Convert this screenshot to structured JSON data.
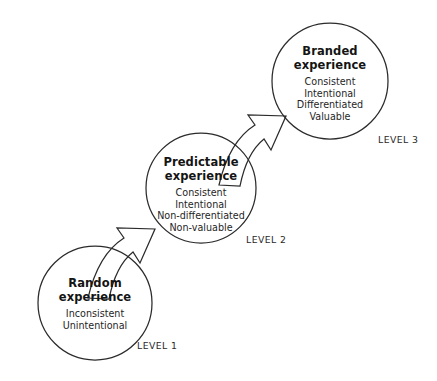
{
  "diagram": {
    "type": "progression-diagram",
    "background_color": "#ffffff",
    "stroke_color": "#2b2b2b",
    "text_color": "#1a1a1a",
    "nodes": [
      {
        "id": "random",
        "title_lines": [
          "Random",
          "experience"
        ],
        "attributes": [
          "Inconsistent",
          "Unintentional"
        ],
        "level_label": "LEVEL 1",
        "circle": {
          "cx": 95,
          "cy": 303,
          "r": 57
        },
        "level_label_pos": {
          "x": 137,
          "y": 340
        }
      },
      {
        "id": "predictable",
        "title_lines": [
          "Predictable",
          "experience"
        ],
        "attributes": [
          "Consistent",
          "Intentional",
          "Non-differentiated",
          "Non-valuable"
        ],
        "level_label": "LEVEL 2",
        "circle": {
          "cx": 201,
          "cy": 188,
          "r": 55
        },
        "level_label_pos": {
          "x": 246,
          "y": 234
        }
      },
      {
        "id": "branded",
        "title_lines": [
          "Branded",
          "experience"
        ],
        "attributes": [
          "Consistent",
          "Intentional",
          "Differentiated",
          "Valuable"
        ],
        "level_label": "LEVEL 3",
        "circle": {
          "cx": 330,
          "cy": 81,
          "r": 58
        },
        "level_label_pos": {
          "x": 378,
          "y": 134
        }
      }
    ],
    "arrows": [
      {
        "id": "arrow-random-to-predictable",
        "from": "random",
        "to": "predictable",
        "direction": "up-right"
      },
      {
        "id": "arrow-predictable-to-branded",
        "from": "predictable",
        "to": "branded",
        "direction": "up-right"
      }
    ]
  }
}
